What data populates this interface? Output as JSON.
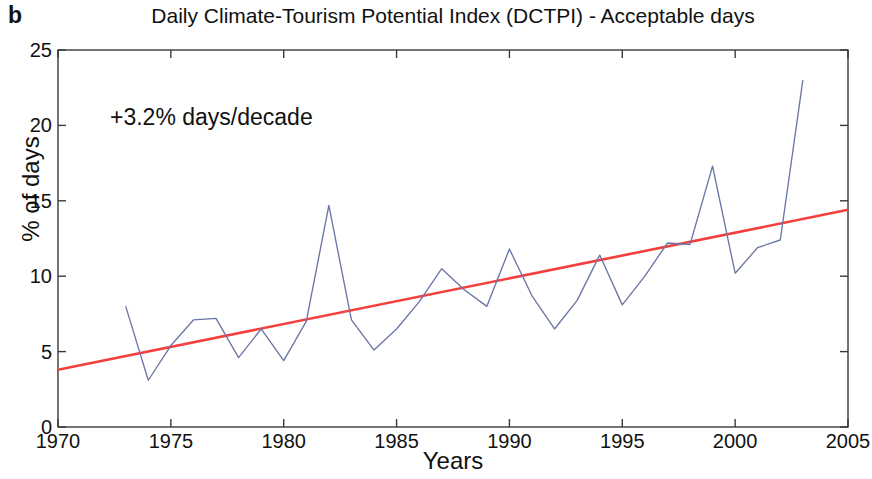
{
  "panel": {
    "label": "b"
  },
  "chart_data": {
    "type": "line",
    "title": "Daily Climate-Tourism Potential Index (DCTPI) - Acceptable days",
    "xlabel": "Years",
    "ylabel": "% of days",
    "xlim": [
      1970,
      2005
    ],
    "ylim": [
      0,
      25
    ],
    "xticks": [
      1970,
      1975,
      1980,
      1985,
      1990,
      1995,
      2000,
      2005
    ],
    "yticks": [
      0,
      5,
      10,
      15,
      20,
      25
    ],
    "grid": false,
    "legend": "none",
    "annotations": [
      {
        "text": "+3.2% days/decade",
        "x": 1972.5,
        "y": 20.0
      }
    ],
    "series": [
      {
        "name": "DCTPI acceptable days",
        "type": "line",
        "color": "#6b76a8",
        "x": [
          1973,
          1974,
          1975,
          1976,
          1977,
          1978,
          1979,
          1980,
          1981,
          1982,
          1983,
          1984,
          1985,
          1986,
          1987,
          1988,
          1989,
          1990,
          1991,
          1992,
          1993,
          1994,
          1995,
          1996,
          1997,
          1998,
          1999,
          2000,
          2001,
          2002,
          2003
        ],
        "values": [
          8.0,
          3.1,
          5.4,
          7.1,
          7.2,
          4.6,
          6.5,
          4.4,
          7.0,
          14.7,
          7.1,
          5.1,
          6.5,
          8.3,
          10.5,
          9.1,
          8.0,
          11.8,
          8.7,
          6.5,
          8.4,
          11.4,
          8.1,
          10.0,
          12.2,
          12.1,
          17.3,
          10.2,
          11.9,
          12.4,
          23.0
        ]
      },
      {
        "name": "Linear trend",
        "type": "line",
        "color": "#f43f3f",
        "x": [
          1970,
          2005
        ],
        "values": [
          3.8,
          14.4
        ]
      }
    ]
  }
}
